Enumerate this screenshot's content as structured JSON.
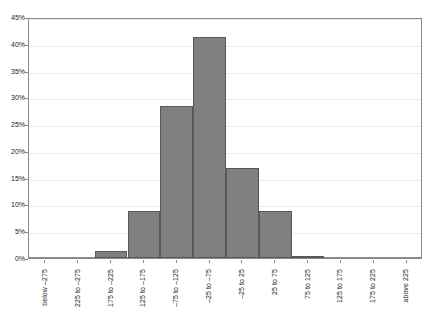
{
  "chart_data": {
    "type": "bar",
    "title": "",
    "subtitle": "",
    "xlabel": "",
    "ylabel": "",
    "categories": [
      "below –275",
      "225 to –275",
      "175 to –225",
      "125 to –175",
      "–75 to –125",
      "–25 to –75",
      "–25 to 25",
      "25 to 75",
      "75 to 125",
      "125 to 175",
      "175 to 225",
      "above 225"
    ],
    "values": [
      0,
      0,
      1.3,
      8.8,
      28.4,
      41.2,
      16.8,
      8.8,
      0.4,
      0,
      0,
      0
    ],
    "value_labels": [
      "0%",
      "0%",
      "1.3%",
      "8.8%",
      "28.4%",
      "41.2%",
      "16.8%",
      "8.8%",
      "0.4%",
      "0%",
      "0%",
      "0%"
    ],
    "ylim": [
      0,
      45
    ],
    "ytick_values": [
      0,
      5,
      10,
      15,
      20,
      25,
      30,
      35,
      40,
      45
    ],
    "ytick_labels": [
      "0%",
      "5%",
      "10%",
      "15%",
      "20%",
      "25%",
      "30%",
      "35%",
      "40%",
      "45%"
    ],
    "grid": true,
    "legend": null,
    "legend_position": "none",
    "bar_color": "#808080",
    "bar_border_color": "#585858",
    "gridline_color": "#ececec",
    "axis_color": "#8a8a8a",
    "text_color": "#1a1a1a",
    "background_color": "#ffffff"
  }
}
